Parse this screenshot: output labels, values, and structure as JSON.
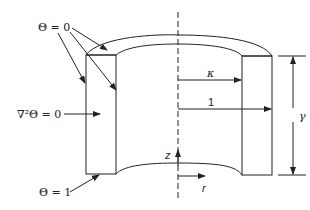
{
  "diagram": {
    "type": "annular cylinder cross-section",
    "labels": {
      "theta_zero": "Θ = 0",
      "laplace": "∇²Θ = 0",
      "theta_one": "Θ = 1",
      "kappa": "κ",
      "one": "1",
      "gamma": "γ",
      "z_axis": "z",
      "r_axis": "r"
    },
    "colors": {
      "line": "#222222",
      "background": "#ffffff"
    }
  }
}
